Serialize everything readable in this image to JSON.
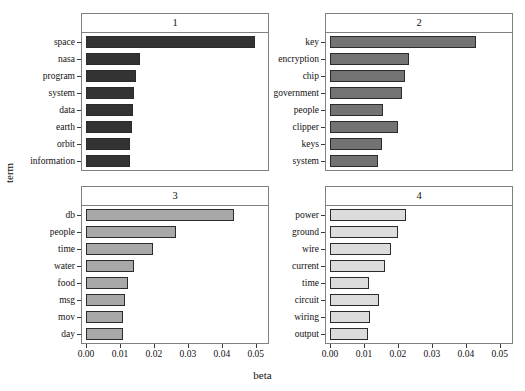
{
  "chart_data": {
    "type": "bar",
    "orientation": "horizontal",
    "title": "",
    "xlabel": "beta",
    "ylabel": "term",
    "xlim": [
      0,
      0.053
    ],
    "xticks": [
      0.0,
      0.01,
      0.02,
      0.03,
      0.04,
      0.05
    ],
    "xtick_labels": [
      "0.00",
      "0.01",
      "0.02",
      "0.03",
      "0.04",
      "0.05"
    ],
    "grid": false,
    "legend": "none",
    "facet_layout": "2x2",
    "facets": [
      {
        "label": "1",
        "fill": "#333333",
        "categories": [
          "space",
          "nasa",
          "program",
          "system",
          "data",
          "earth",
          "orbit",
          "information"
        ],
        "values": [
          0.0497,
          0.0159,
          0.0148,
          0.014,
          0.0139,
          0.0135,
          0.013,
          0.0129
        ]
      },
      {
        "label": "2",
        "fill": "#737373",
        "categories": [
          "key",
          "encryption",
          "chip",
          "government",
          "people",
          "clipper",
          "keys",
          "system"
        ],
        "values": [
          0.043,
          0.0232,
          0.0222,
          0.0213,
          0.0155,
          0.02,
          0.0153,
          0.014
        ]
      },
      {
        "label": "3",
        "fill": "#a8a8a8",
        "categories": [
          "db",
          "people",
          "time",
          "water",
          "food",
          "msg",
          "mov",
          "day"
        ],
        "values": [
          0.0437,
          0.0265,
          0.0197,
          0.014,
          0.0125,
          0.0114,
          0.011,
          0.011
        ]
      },
      {
        "label": "4",
        "fill": "#dcdcdc",
        "categories": [
          "power",
          "ground",
          "wire",
          "current",
          "time",
          "circuit",
          "wiring",
          "output"
        ],
        "values": [
          0.0224,
          0.0199,
          0.018,
          0.0162,
          0.0114,
          0.0145,
          0.0119,
          0.0112
        ]
      }
    ]
  }
}
